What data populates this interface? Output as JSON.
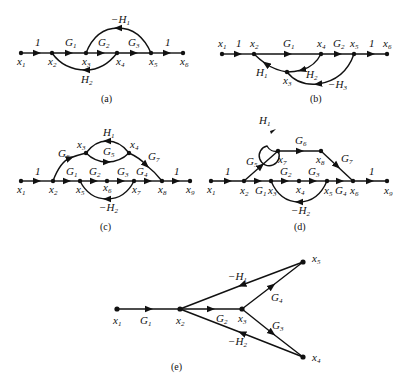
{
  "figures": [
    {
      "id": "a",
      "caption": "(a)",
      "nodes": [
        "x1",
        "x2",
        "x3",
        "x4",
        "x5",
        "x6"
      ],
      "branches": [
        {
          "from": "x1",
          "to": "x2",
          "gain": "1"
        },
        {
          "from": "x2",
          "to": "x3",
          "gain": "G1"
        },
        {
          "from": "x3",
          "to": "x4",
          "gain": "G2"
        },
        {
          "from": "x4",
          "to": "x5",
          "gain": "G3"
        },
        {
          "from": "x5",
          "to": "x6",
          "gain": "1"
        },
        {
          "from": "x5",
          "to": "x3",
          "gain": "-H1"
        },
        {
          "from": "x4",
          "to": "x2",
          "gain": "H2"
        }
      ]
    },
    {
      "id": "b",
      "caption": "(b)",
      "nodes": [
        "x1",
        "x2",
        "x3",
        "x4",
        "x5",
        "x6"
      ],
      "branches": [
        {
          "from": "x1",
          "to": "x2",
          "gain": "1"
        },
        {
          "from": "x2",
          "to": "x4",
          "gain": "G1"
        },
        {
          "from": "x4",
          "to": "x5",
          "gain": "G2"
        },
        {
          "from": "x5",
          "to": "x6",
          "gain": "1"
        },
        {
          "from": "x3",
          "to": "x2",
          "gain": "H1"
        },
        {
          "from": "x4",
          "to": "x3",
          "gain": "H2"
        },
        {
          "from": "x5",
          "to": "x3",
          "gain": "-H3"
        }
      ]
    },
    {
      "id": "c",
      "caption": "(c)",
      "nodes": [
        "x1",
        "x2",
        "x3",
        "x4",
        "x5",
        "x6",
        "x7",
        "x8",
        "x9"
      ],
      "branches": [
        {
          "from": "x1",
          "to": "x2",
          "gain": "1"
        },
        {
          "from": "x2",
          "to": "x5",
          "gain": "G1"
        },
        {
          "from": "x5",
          "to": "x6",
          "gain": "G2"
        },
        {
          "from": "x6",
          "to": "x7",
          "gain": "G3"
        },
        {
          "from": "x7",
          "to": "x8",
          "gain": "G4"
        },
        {
          "from": "x8",
          "to": "x9",
          "gain": "1"
        },
        {
          "from": "x2",
          "to": "x3",
          "gain": "G6"
        },
        {
          "from": "x3",
          "to": "x4",
          "gain": "G5"
        },
        {
          "from": "x4",
          "to": "x3",
          "gain": "H1"
        },
        {
          "from": "x4",
          "to": "x8",
          "gain": "G7"
        },
        {
          "from": "x7",
          "to": "x5",
          "gain": "-H2"
        }
      ]
    },
    {
      "id": "d",
      "caption": "(d)",
      "nodes": [
        "x1",
        "x2",
        "x3",
        "x4",
        "x5",
        "x6",
        "x7",
        "x8",
        "x9"
      ],
      "branches": [
        {
          "from": "x1",
          "to": "x2",
          "gain": "1"
        },
        {
          "from": "x2",
          "to": "x3",
          "gain": "G1"
        },
        {
          "from": "x3",
          "to": "x4",
          "gain": "G2"
        },
        {
          "from": "x4",
          "to": "x5",
          "gain": "G3"
        },
        {
          "from": "x5",
          "to": "x6",
          "gain": "G4"
        },
        {
          "from": "x6",
          "to": "x9",
          "gain": "1"
        },
        {
          "from": "x2",
          "to": "x7",
          "gain": "G5"
        },
        {
          "from": "x7",
          "to": "x7",
          "gain": "H1"
        },
        {
          "from": "x7",
          "to": "x8",
          "gain": "G6"
        },
        {
          "from": "x8",
          "to": "x6",
          "gain": "G7"
        },
        {
          "from": "x5",
          "to": "x3",
          "gain": "-H2"
        }
      ]
    },
    {
      "id": "e",
      "caption": "(e)",
      "nodes": [
        "x1",
        "x2",
        "x3",
        "x4",
        "x5"
      ],
      "branches": [
        {
          "from": "x1",
          "to": "x2",
          "gain": "G1"
        },
        {
          "from": "x2",
          "to": "x3",
          "gain": "G2"
        },
        {
          "from": "x3",
          "to": "x5",
          "gain": "G4"
        },
        {
          "from": "x3",
          "to": "x4",
          "gain": "G3"
        },
        {
          "from": "x5",
          "to": "x2",
          "gain": "-H1"
        },
        {
          "from": "x4",
          "to": "x2",
          "gain": "-H2"
        }
      ]
    }
  ],
  "labels": {
    "a": {
      "caption": "(a)",
      "one": "1",
      "G1": "G",
      "G2": "G",
      "G3": "G",
      "H1": "−H",
      "H2": "H"
    },
    "sub": {
      "1": "1",
      "2": "2",
      "3": "3",
      "4": "4",
      "5": "5",
      "6": "6",
      "7": "7",
      "8": "8",
      "9": "9"
    },
    "x": "x",
    "G": "G",
    "H": "H",
    "negH": "−H",
    "one": "1",
    "captions": {
      "a": "(a)",
      "b": "(b)",
      "c": "(c)",
      "d": "(d)",
      "e": "(e)"
    }
  }
}
